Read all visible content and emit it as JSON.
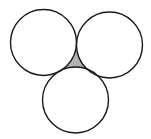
{
  "diagram": {
    "type": "three-tangent-circles",
    "stroke_color": "#1a1a1a",
    "fill_color": "#ffffff",
    "shaded_region_color": "#b3b3b3",
    "stroke_width": 1.4,
    "circles": [
      {
        "name": "left-circle",
        "cx": 43.5,
        "cy": 42.5,
        "r": 33
      },
      {
        "name": "right-circle",
        "cx": 109.5,
        "cy": 45,
        "r": 33
      },
      {
        "name": "bottom-circle",
        "cx": 75.5,
        "cy": 100,
        "r": 33
      }
    ],
    "shaded_region": "curvilinear triangle between the three circles"
  }
}
